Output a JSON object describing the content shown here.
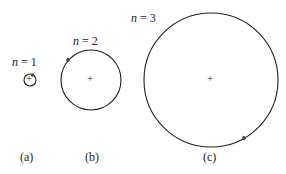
{
  "figure": {
    "panels": [
      {
        "id": "a",
        "caption": "(a)",
        "n_label_var": "n",
        "n_label_rest": " = 1",
        "n": 1
      },
      {
        "id": "b",
        "caption": "(b)",
        "n_label_var": "n",
        "n_label_rest": " = 2",
        "n": 2
      },
      {
        "id": "c",
        "caption": "(c)",
        "n_label_var": "n",
        "n_label_rest": " = 3",
        "n": 3
      }
    ],
    "nucleus_symbol": "+",
    "colors": {
      "orbit": "#222222",
      "electron": "#444444"
    }
  }
}
